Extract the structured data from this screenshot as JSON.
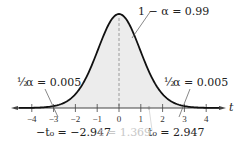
{
  "chart_data": {
    "type": "area",
    "title": "",
    "xlabel": "t",
    "ylabel": "",
    "distribution": "Student t (bell curve)",
    "x_ticks": [
      -4,
      -3,
      -2,
      -1,
      0,
      1,
      2,
      3,
      4
    ],
    "xlim": [
      -4.6,
      4.6
    ],
    "grid": false,
    "critical_values": {
      "negative": -2.947,
      "positive": 2.947
    },
    "test_statistic": 1.369,
    "center_area": 0.99,
    "tail_area_each": 0.005,
    "annotations": {
      "center": "1 − α = 0.99",
      "left_tail_prefix": "½",
      "left_tail": "α = 0.005",
      "right_tail_prefix": "½",
      "right_tail": "α = 0.005",
      "neg_critical": "−t₀ = −2.947",
      "pos_critical": "t₀ = 2.947",
      "test_stat": "t = 1.369"
    },
    "axis_label": "t",
    "colors": {
      "curve": "#111111",
      "fill": "#ececec",
      "axis": "#444444",
      "faint_text": "#c8c8c8"
    }
  }
}
